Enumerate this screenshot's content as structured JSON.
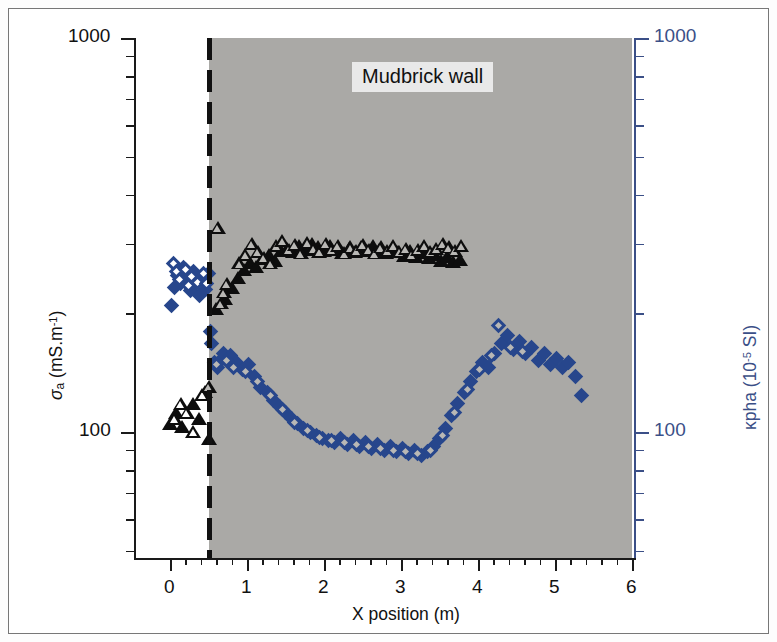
{
  "figure": {
    "background_color": "#ffffff",
    "frame_color": "#777777",
    "shade_color": "#aaa9a6",
    "accent_blue": "#27468c",
    "axis_blue": "#3b4f87"
  },
  "annotation": {
    "wall_label": "Mudbrick wall"
  },
  "chart_data": {
    "type": "scatter",
    "title": "",
    "xlabel": "X position (m)",
    "ylabel_left": "σa (mS.m-1)",
    "ylabel_right": "κpha (10-5 SI)",
    "xlim": [
      0,
      6
    ],
    "xticks": [
      0,
      1,
      2,
      3,
      4,
      5,
      6
    ],
    "xticklabels": [
      "0",
      "1",
      "2",
      "3",
      "4",
      "5",
      "6"
    ],
    "xminor_step": 0.2,
    "yscale": "log",
    "ylim_left": [
      50,
      1000
    ],
    "yticks_left": [
      100,
      1000
    ],
    "yticklabels_left": [
      "100",
      "1000"
    ],
    "ylim_right": [
      50,
      1000
    ],
    "yticks_right": [
      100,
      1000
    ],
    "yticklabels_right": [
      "100",
      "1000"
    ],
    "grid": false,
    "legend": "none",
    "shaded_region_x": [
      0.5,
      6.0
    ],
    "shaded_region_note": "Mudbrick wall extent (grey band)",
    "dashed_line_x": 0.5,
    "series": [
      {
        "name": "sigma_a filled triangle",
        "marker": "triangle-filled",
        "color": "#0d0d0d",
        "axis": "left",
        "unit": "mS.m-1",
        "points": [
          [
            0.0,
            105
          ],
          [
            0.08,
            112
          ],
          [
            0.16,
            103
          ],
          [
            0.3,
            118
          ],
          [
            0.38,
            108
          ],
          [
            0.46,
            126
          ],
          [
            0.5,
            96
          ],
          [
            0.6,
            205
          ],
          [
            0.72,
            218
          ],
          [
            0.8,
            232
          ],
          [
            0.88,
            246
          ],
          [
            0.96,
            258
          ],
          [
            1.04,
            268
          ],
          [
            1.12,
            262
          ],
          [
            1.2,
            275
          ],
          [
            1.28,
            282
          ],
          [
            1.36,
            272
          ],
          [
            1.44,
            288
          ],
          [
            1.52,
            292
          ],
          [
            1.6,
            286
          ],
          [
            1.68,
            296
          ],
          [
            1.76,
            290
          ],
          [
            1.84,
            300
          ],
          [
            1.92,
            294
          ],
          [
            2.0,
            288
          ],
          [
            2.08,
            296
          ],
          [
            2.16,
            290
          ],
          [
            2.24,
            284
          ],
          [
            2.32,
            292
          ],
          [
            2.4,
            286
          ],
          [
            2.48,
            294
          ],
          [
            2.56,
            288
          ],
          [
            2.64,
            296
          ],
          [
            2.72,
            290
          ],
          [
            2.8,
            284
          ],
          [
            2.88,
            292
          ],
          [
            2.96,
            286
          ],
          [
            3.04,
            280
          ],
          [
            3.12,
            288
          ],
          [
            3.2,
            278
          ],
          [
            3.28,
            284
          ],
          [
            3.36,
            276
          ],
          [
            3.44,
            282
          ],
          [
            3.52,
            272
          ],
          [
            3.6,
            278
          ],
          [
            3.68,
            270
          ],
          [
            3.76,
            274
          ]
        ]
      },
      {
        "name": "sigma_a open triangle",
        "marker": "triangle-open",
        "color": "#0d0d0d",
        "axis": "left",
        "unit": "mS.m-1",
        "points": [
          [
            0.06,
            108
          ],
          [
            0.14,
            118
          ],
          [
            0.22,
            112
          ],
          [
            0.3,
            100
          ],
          [
            0.42,
            124
          ],
          [
            0.5,
            130
          ],
          [
            0.62,
            330
          ],
          [
            0.66,
            212
          ],
          [
            0.7,
            226
          ],
          [
            0.74,
            238
          ],
          [
            0.9,
            268
          ],
          [
            0.98,
            282
          ],
          [
            1.06,
            300
          ],
          [
            1.14,
            286
          ],
          [
            1.22,
            276
          ],
          [
            1.3,
            268
          ],
          [
            1.38,
            296
          ],
          [
            1.46,
            306
          ],
          [
            1.54,
            290
          ],
          [
            1.62,
            298
          ],
          [
            1.7,
            284
          ],
          [
            1.78,
            302
          ],
          [
            1.86,
            292
          ],
          [
            1.94,
            286
          ],
          [
            2.02,
            300
          ],
          [
            2.1,
            290
          ],
          [
            2.18,
            296
          ],
          [
            2.26,
            284
          ],
          [
            2.34,
            294
          ],
          [
            2.42,
            288
          ],
          [
            2.5,
            298
          ],
          [
            2.58,
            290
          ],
          [
            2.66,
            284
          ],
          [
            2.74,
            294
          ],
          [
            2.82,
            288
          ],
          [
            2.9,
            296
          ],
          [
            2.98,
            286
          ],
          [
            3.06,
            292
          ],
          [
            3.14,
            282
          ],
          [
            3.22,
            290
          ],
          [
            3.3,
            296
          ],
          [
            3.38,
            286
          ],
          [
            3.46,
            292
          ],
          [
            3.54,
            300
          ],
          [
            3.62,
            294
          ],
          [
            3.7,
            288
          ],
          [
            3.78,
            296
          ]
        ]
      },
      {
        "name": "kappa_pha filled diamond",
        "marker": "diamond-filled",
        "color": "#27468c",
        "axis": "right",
        "unit": "10-5 SI",
        "points": [
          [
            0.02,
            210
          ],
          [
            0.06,
            232
          ],
          [
            0.1,
            250
          ],
          [
            0.14,
            238
          ],
          [
            0.18,
            262
          ],
          [
            0.22,
            246
          ],
          [
            0.26,
            228
          ],
          [
            0.3,
            256
          ],
          [
            0.34,
            240
          ],
          [
            0.38,
            222
          ],
          [
            0.42,
            248
          ],
          [
            0.46,
            230
          ],
          [
            0.5,
            252
          ],
          [
            0.52,
            180
          ],
          [
            0.54,
            168
          ],
          [
            0.58,
            150
          ],
          [
            0.62,
            146
          ],
          [
            0.66,
            152
          ],
          [
            0.7,
            158
          ],
          [
            0.78,
            156
          ],
          [
            0.86,
            150
          ],
          [
            0.94,
            144
          ],
          [
            1.02,
            148
          ],
          [
            1.1,
            138
          ],
          [
            1.18,
            130
          ],
          [
            1.26,
            126
          ],
          [
            1.34,
            120
          ],
          [
            1.42,
            116
          ],
          [
            1.5,
            112
          ],
          [
            1.58,
            108
          ],
          [
            1.66,
            105
          ],
          [
            1.74,
            102
          ],
          [
            1.82,
            100
          ],
          [
            1.9,
            98
          ],
          [
            1.98,
            96
          ],
          [
            2.06,
            95
          ],
          [
            2.14,
            94
          ],
          [
            2.22,
            96
          ],
          [
            2.3,
            93
          ],
          [
            2.38,
            95
          ],
          [
            2.46,
            92
          ],
          [
            2.54,
            94
          ],
          [
            2.62,
            91
          ],
          [
            2.7,
            93
          ],
          [
            2.78,
            90
          ],
          [
            2.86,
            92
          ],
          [
            2.94,
            89
          ],
          [
            3.02,
            91
          ],
          [
            3.1,
            88
          ],
          [
            3.18,
            90
          ],
          [
            3.26,
            87
          ],
          [
            3.34,
            89
          ],
          [
            3.42,
            92
          ],
          [
            3.5,
            96
          ],
          [
            3.58,
            102
          ],
          [
            3.66,
            110
          ],
          [
            3.74,
            118
          ],
          [
            3.82,
            126
          ],
          [
            3.9,
            134
          ],
          [
            3.98,
            142
          ],
          [
            4.06,
            150
          ],
          [
            4.14,
            146
          ],
          [
            4.22,
            158
          ],
          [
            4.3,
            168
          ],
          [
            4.38,
            176
          ],
          [
            4.46,
            162
          ],
          [
            4.54,
            170
          ],
          [
            4.62,
            158
          ],
          [
            4.7,
            164
          ],
          [
            4.78,
            152
          ],
          [
            4.86,
            158
          ],
          [
            4.94,
            148
          ],
          [
            5.02,
            154
          ],
          [
            5.1,
            146
          ],
          [
            5.18,
            150
          ],
          [
            5.26,
            138
          ],
          [
            5.34,
            124
          ]
        ]
      },
      {
        "name": "kappa_pha open diamond",
        "marker": "diamond-open",
        "color": "#27468c",
        "axis": "right",
        "unit": "10-5 SI",
        "points": [
          [
            0.04,
            268
          ],
          [
            0.08,
            255
          ],
          [
            0.12,
            244
          ],
          [
            0.2,
            258
          ],
          [
            0.24,
            236
          ],
          [
            0.28,
            248
          ],
          [
            0.36,
            240
          ],
          [
            0.44,
            252
          ],
          [
            0.48,
            238
          ],
          [
            0.6,
            148
          ],
          [
            0.74,
            152
          ],
          [
            0.82,
            146
          ],
          [
            0.98,
            142
          ],
          [
            1.14,
            134
          ],
          [
            1.3,
            124
          ],
          [
            1.46,
            114
          ],
          [
            1.62,
            106
          ],
          [
            1.78,
            101
          ],
          [
            1.94,
            97
          ],
          [
            2.1,
            95
          ],
          [
            2.26,
            94
          ],
          [
            2.42,
            93
          ],
          [
            2.58,
            92
          ],
          [
            2.74,
            91
          ],
          [
            2.9,
            90
          ],
          [
            3.06,
            89
          ],
          [
            3.22,
            88
          ],
          [
            3.38,
            90
          ],
          [
            3.54,
            98
          ],
          [
            3.7,
            112
          ],
          [
            3.86,
            128
          ],
          [
            4.02,
            144
          ],
          [
            4.18,
            156
          ],
          [
            4.26,
            186
          ],
          [
            4.42,
            164
          ],
          [
            4.58,
            160
          ]
        ]
      }
    ]
  }
}
